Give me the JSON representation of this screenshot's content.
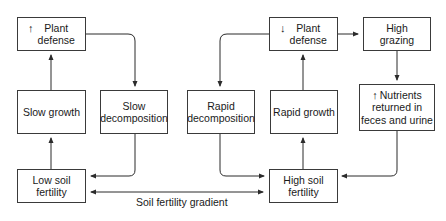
{
  "diagram": {
    "nodes": {
      "plant_defense_low": {
        "indicator": "↑",
        "line1": "Plant",
        "line2": "defense"
      },
      "slow_growth": {
        "text": "Slow growth"
      },
      "slow_decomposition": {
        "line1": "Slow",
        "line2": "decomposition"
      },
      "low_soil_fertility": {
        "line1": "Low soil",
        "line2": "fertility"
      },
      "rapid_decomposition": {
        "line1": "Rapid",
        "line2": "decomposition"
      },
      "rapid_growth": {
        "text": "Rapid growth"
      },
      "plant_defense_high": {
        "indicator": "↓",
        "line1": "Plant",
        "line2": "defense"
      },
      "high_grazing": {
        "line1": "High",
        "line2": "grazing"
      },
      "nutrients_returned": {
        "indicator": "↑",
        "line1": "Nutrients",
        "line2": "returned in",
        "line3": "feces and urine"
      },
      "high_soil_fertility": {
        "line1": "High soil",
        "line2": "fertility"
      }
    },
    "gradient_label": "Soil fertility gradient",
    "edges": [
      {
        "from": "Low soil fertility",
        "to": "Slow growth"
      },
      {
        "from": "Slow growth",
        "to": "↑ Plant defense"
      },
      {
        "from": "↑ Plant defense",
        "to": "Slow decomposition"
      },
      {
        "from": "Slow decomposition",
        "to": "Low soil fertility"
      },
      {
        "from": "High soil fertility",
        "to": "Rapid growth"
      },
      {
        "from": "Rapid growth",
        "to": "↓ Plant defense"
      },
      {
        "from": "↓ Plant defense",
        "to": "Rapid decomposition"
      },
      {
        "from": "Rapid decomposition",
        "to": "High soil fertility"
      },
      {
        "from": "↓ Plant defense",
        "to": "High grazing"
      },
      {
        "from": "High grazing",
        "to": "↑ Nutrients returned in feces and urine"
      },
      {
        "from": "↑ Nutrients returned in feces and urine",
        "to": "High soil fertility"
      },
      {
        "from": "Low soil fertility",
        "to": "High soil fertility",
        "label": "Soil fertility gradient",
        "bidirectional": true
      }
    ],
    "colors": {
      "line": "#2b2b2b",
      "box_border": "#3a3a3a",
      "background": "#ffffff"
    }
  }
}
